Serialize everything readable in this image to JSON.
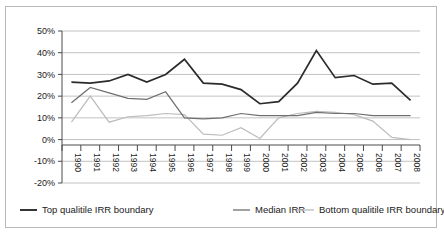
{
  "chart_data": {
    "type": "line",
    "title": "",
    "xlabel": "",
    "ylabel": "",
    "ylim": [
      -20,
      50
    ],
    "ytick_labels": [
      "50%",
      "40%",
      "30%",
      "20%",
      "10%",
      "0%",
      "-10%",
      "-20%"
    ],
    "ytick_values": [
      50,
      40,
      30,
      20,
      10,
      0,
      -10,
      -20
    ],
    "grid": true,
    "legend_position": "bottom",
    "categories": [
      "1990",
      "1991",
      "1992",
      "1993",
      "1994",
      "1995",
      "1996",
      "1997",
      "1998",
      "1999",
      "2000",
      "2001",
      "2002",
      "2003",
      "2004",
      "2005",
      "2006",
      "2007",
      "2008"
    ],
    "series": [
      {
        "name": "Top qualitile IRR boundary",
        "color": "#2b2b2b",
        "values": [
          26.5,
          26.0,
          27.0,
          30.0,
          26.5,
          30.0,
          37.0,
          26.0,
          25.5,
          23.0,
          16.5,
          17.5,
          26.0,
          41.0,
          28.5,
          29.5,
          25.5,
          26.0,
          18.0
        ]
      },
      {
        "name": "Median IRR",
        "color": "#6f6f6f",
        "values": [
          17.0,
          24.0,
          21.5,
          19.0,
          18.5,
          22.0,
          10.0,
          9.5,
          10.0,
          12.0,
          11.0,
          11.0,
          11.0,
          12.5,
          12.0,
          12.0,
          11.0,
          11.0,
          11.0
        ]
      },
      {
        "name": "Bottom qualitile IRR boundary",
        "color": "#bcbcbc",
        "values": [
          8.0,
          20.0,
          8.0,
          10.5,
          11.0,
          12.0,
          11.5,
          2.5,
          2.0,
          5.5,
          0.5,
          10.0,
          12.0,
          13.0,
          12.5,
          11.5,
          8.5,
          1.0,
          0.0
        ]
      }
    ]
  },
  "legend": {
    "items": [
      {
        "label": "Top qualitile IRR boundary"
      },
      {
        "label": "Median IRR"
      },
      {
        "label": "Bottom qualitile IRR boundary"
      }
    ]
  }
}
